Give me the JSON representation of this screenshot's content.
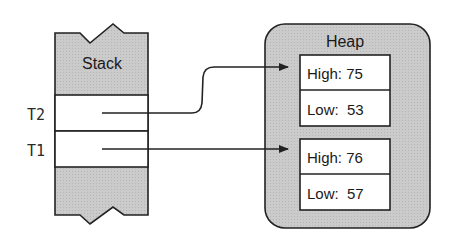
{
  "stack": {
    "title": "Stack",
    "slots": [
      {
        "label": "T2",
        "points_to": 0
      },
      {
        "label": "T1",
        "points_to": 1
      }
    ]
  },
  "heap": {
    "title": "Heap",
    "objects": [
      {
        "fields": [
          {
            "text": "High: 75"
          },
          {
            "text": "Low:  53"
          }
        ]
      },
      {
        "fields": [
          {
            "text": "High: 76"
          },
          {
            "text": "Low:  57"
          }
        ]
      }
    ]
  },
  "colors": {
    "fill_gray": "#c8c8c8",
    "stroke": "#222222",
    "cell": "#ffffff"
  }
}
